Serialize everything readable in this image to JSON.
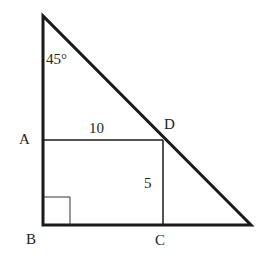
{
  "diagram": {
    "type": "geometry",
    "points": {
      "A": "A",
      "B": "B",
      "C": "C",
      "D": "D"
    },
    "angle_label": "45°",
    "length_AD": "10",
    "length_DC": "5",
    "right_angle_at": "B",
    "colors": {
      "stroke": "#1a1a1a",
      "background": "#ffffff"
    }
  }
}
